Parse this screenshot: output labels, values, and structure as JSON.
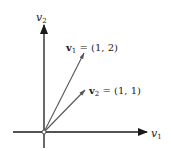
{
  "diagram": {
    "type": "vector-plane",
    "axes": {
      "x": {
        "name": "v",
        "subscript": "1"
      },
      "y": {
        "name": "v",
        "subscript": "2"
      }
    },
    "vectors": [
      {
        "name": "v",
        "subscript": "1",
        "eq": " = (1, 2)",
        "components": [
          1,
          2
        ]
      },
      {
        "name": "v",
        "subscript": "2",
        "eq": " = (1, 1)",
        "components": [
          1,
          1
        ]
      }
    ],
    "colors": {
      "axis": "#1a1a1a",
      "vector": "#555555",
      "text": "#222222"
    }
  }
}
